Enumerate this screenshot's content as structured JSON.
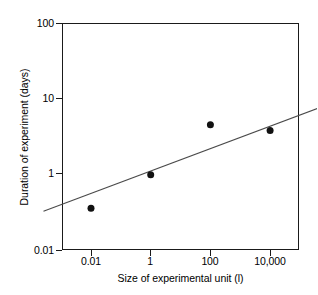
{
  "chart_data": {
    "type": "scatter",
    "title": "",
    "xlabel": "Size of experimental unit (l)",
    "ylabel": "Duration of experiment (days)",
    "xscale": "log",
    "yscale": "log",
    "xlim": [
      0.0016,
      46000
    ],
    "ylim": [
      0.01,
      100
    ],
    "xticks": [
      0.01,
      1,
      100,
      10000
    ],
    "xtick_labels": [
      "0.01",
      "1",
      "100",
      "10,000"
    ],
    "yticks": [
      0.01,
      1,
      10,
      100
    ],
    "ytick_labels": [
      "0.01",
      "1",
      "10",
      "100"
    ],
    "grid": false,
    "legend": false,
    "marker": "filled-circle",
    "marker_color": "#111111",
    "marker_size_px": 7,
    "points": [
      {
        "x": 0.01,
        "y": 0.34
      },
      {
        "x": 0.1,
        "y": 0.95
      },
      {
        "x": 1,
        "y": 4.4
      },
      {
        "x": 10,
        "y": 3.7
      },
      {
        "x": 100,
        "y": 2.6
      },
      {
        "x": 1000,
        "y": 31
      },
      {
        "x": 10000,
        "y": 17
      }
    ],
    "trendline": {
      "type": "line",
      "color": "#4a4a4a",
      "x_start": 0.0016,
      "y_start": 0.31,
      "x_end": 46000,
      "y_end": 52
    }
  },
  "axes": {
    "frame_color": "#1a1a1a",
    "background": "#ffffff"
  }
}
